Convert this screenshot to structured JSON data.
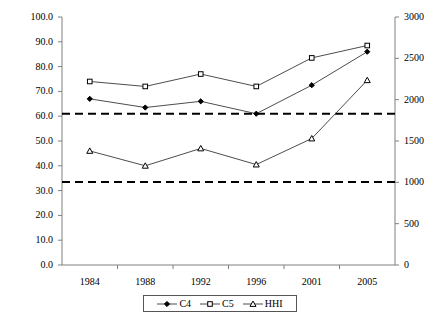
{
  "chart_data": {
    "type": "line",
    "title": "",
    "subtitle": "",
    "xlabel": "",
    "ylabel": "",
    "y2label": "",
    "categories": [
      "1984",
      "1988",
      "1992",
      "1996",
      "2001",
      "2005"
    ],
    "x_tick_labels": [
      "1984",
      "1988",
      "1992",
      "1996",
      "2001",
      "2005"
    ],
    "ylim": [
      0.0,
      100.0
    ],
    "y_tick_labels": [
      "0.0",
      "10.0",
      "20.0",
      "30.0",
      "40.0",
      "50.0",
      "60.0",
      "70.0",
      "80.0",
      "90.0",
      "100.0"
    ],
    "y_ticks": [
      0,
      10,
      20,
      30,
      40,
      50,
      60,
      70,
      80,
      90,
      100
    ],
    "y2lim": [
      0,
      3000
    ],
    "y2_tick_labels": [
      "0",
      "500",
      "1000",
      "1500",
      "2000",
      "2500",
      "3000"
    ],
    "y2_ticks": [
      0,
      500,
      1000,
      1500,
      2000,
      2500,
      3000
    ],
    "grid": false,
    "legend_position": "bottom",
    "series": [
      {
        "name": "C4",
        "axis": "left",
        "marker": "filled-diamond",
        "color": "#000000",
        "values": [
          67.0,
          63.5,
          66.0,
          61.0,
          72.5,
          86.0
        ]
      },
      {
        "name": "C5",
        "axis": "left",
        "marker": "open-square",
        "color": "#000000",
        "values": [
          74.0,
          72.0,
          77.0,
          72.0,
          83.5,
          88.5
        ]
      },
      {
        "name": "HHI",
        "axis": "right",
        "marker": "open-triangle",
        "color": "#000000",
        "values": [
          1150,
          990,
          1180,
          1000,
          1265,
          1850
        ],
        "values_left_scale": [
          46.0,
          40.0,
          47.0,
          40.5,
          51.0,
          74.5
        ]
      }
    ],
    "annotations": [
      {
        "type": "hline",
        "name": "hhi-upper-threshold",
        "value_left_scale": 61.0,
        "value_right_scale": 1800,
        "style": "dashed"
      },
      {
        "type": "hline",
        "name": "hhi-lower-threshold",
        "value_left_scale": 33.5,
        "value_right_scale": 1000,
        "style": "dashed"
      }
    ]
  },
  "legend": {
    "items": [
      {
        "label": "C4",
        "marker": "filled-diamond"
      },
      {
        "label": "C5",
        "marker": "open-square"
      },
      {
        "label": "HHI",
        "marker": "open-triangle"
      }
    ]
  },
  "axis_colors": {
    "left_axis": "#808080",
    "right_axis": "#808080",
    "bottom_axis": "#808080",
    "series_line": "#4d4d4d",
    "threshold_line": "#000000"
  }
}
